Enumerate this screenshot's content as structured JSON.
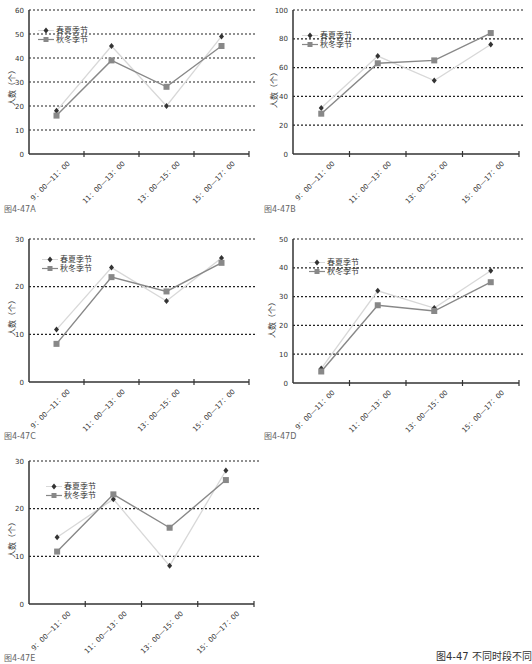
{
  "main_caption": "图4-47 不同时段不同",
  "legend": {
    "series1": "春夏季节",
    "series2": "秋冬季节"
  },
  "ylabel": "人数（个）",
  "colors": {
    "series1_line": "#d8d8d8",
    "series1_marker": "#333333",
    "series2_line": "#888888",
    "series2_marker": "#888888",
    "grid": "#222222",
    "axis": "#333333"
  },
  "chart_data": [
    {
      "id": "A",
      "caption": "图4-47A",
      "type": "line",
      "categories": [
        "9：00—11：00",
        "11：00—13：00",
        "13：00—15：00",
        "15：00—17：00"
      ],
      "series": [
        {
          "name": "春夏季节",
          "values": [
            18,
            45,
            20,
            49
          ]
        },
        {
          "name": "秋冬季节",
          "values": [
            16,
            39,
            28,
            45
          ]
        }
      ],
      "ylabel": "人数（个）",
      "ylim": [
        0,
        60
      ],
      "yticks": [
        0,
        10,
        20,
        30,
        40,
        50,
        60
      ],
      "grid": true,
      "legend_position": "upper-left"
    },
    {
      "id": "B",
      "caption": "图4-47B",
      "type": "line",
      "categories": [
        "9：00—11：00",
        "11：00—13：00",
        "13：00—15：00",
        "15：00—17：00"
      ],
      "series": [
        {
          "name": "春夏季节",
          "values": [
            32,
            68,
            51,
            76
          ]
        },
        {
          "name": "秋冬季节",
          "values": [
            28,
            63,
            65,
            84
          ]
        }
      ],
      "ylabel": "人数（个）",
      "ylim": [
        0,
        100
      ],
      "yticks": [
        0,
        20,
        40,
        60,
        80,
        100
      ],
      "grid": true,
      "legend_position": "upper-left"
    },
    {
      "id": "C",
      "caption": "图4-47C",
      "type": "line",
      "categories": [
        "9：00—11：00",
        "11：00—13：00",
        "13：00—15：00",
        "15：00—17：00"
      ],
      "series": [
        {
          "name": "春夏季节",
          "values": [
            11,
            24,
            17,
            26
          ]
        },
        {
          "name": "秋冬季节",
          "values": [
            8,
            22,
            19,
            25
          ]
        }
      ],
      "ylabel": "人数（个）",
      "ylim": [
        0,
        30
      ],
      "yticks": [
        0,
        10,
        20,
        30
      ],
      "grid": true,
      "legend_position": "upper-left"
    },
    {
      "id": "D",
      "caption": "图4-47D",
      "type": "line",
      "categories": [
        "9：00—11：00",
        "11：00—13：00",
        "13：00—15：00",
        "15：00—17：00"
      ],
      "series": [
        {
          "name": "春夏季节",
          "values": [
            5,
            32,
            26,
            39
          ]
        },
        {
          "name": "秋冬季节",
          "values": [
            4,
            27,
            25,
            35
          ]
        }
      ],
      "ylabel": "人数（个）",
      "ylim": [
        0,
        50
      ],
      "yticks": [
        0,
        10,
        20,
        30,
        40,
        50
      ],
      "grid": true,
      "legend_position": "upper-left"
    },
    {
      "id": "E",
      "caption": "图4-47E",
      "type": "line",
      "categories": [
        "9：00—11：00",
        "11：00—13：00",
        "13：00—15：00",
        "15：00—17：00"
      ],
      "series": [
        {
          "name": "春夏季节",
          "values": [
            14,
            22,
            8,
            28
          ]
        },
        {
          "name": "秋冬季节",
          "values": [
            11,
            23,
            16,
            26
          ]
        }
      ],
      "ylabel": "人数（个）",
      "ylim": [
        0,
        30
      ],
      "yticks": [
        0,
        10,
        20,
        30
      ],
      "grid": true,
      "legend_position": "upper-left"
    }
  ]
}
